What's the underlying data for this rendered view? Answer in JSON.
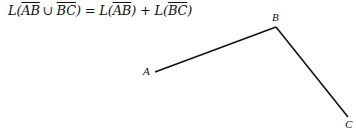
{
  "formula": {
    "L1": "L(",
    "seg1": "AB",
    "union": "∪",
    "seg2": "BC",
    "eq": ") = L(",
    "seg3": "AB",
    "plus": ") + L(",
    "seg4": "BC",
    "close": ")"
  },
  "diagram": {
    "points": {
      "A": {
        "label": "A",
        "x": 155,
        "y": 72
      },
      "B": {
        "label": "B",
        "x": 276,
        "y": 27
      },
      "C": {
        "label": "C",
        "x": 348,
        "y": 117
      }
    },
    "segments": [
      "AB",
      "BC"
    ],
    "line_color": "#111111"
  }
}
